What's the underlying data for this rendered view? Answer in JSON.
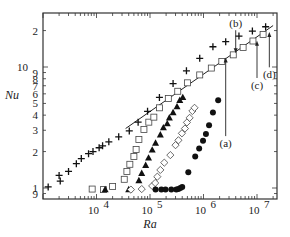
{
  "chart_data": {
    "type": "scatter",
    "title": "",
    "xlabel": "Ra",
    "ylabel": "Nu",
    "xscale": "log",
    "yscale": "log",
    "xlim": [
      1000,
      23000000
    ],
    "ylim": [
      0.86,
      24
    ],
    "grid": false,
    "legend": null,
    "x_ticks": [
      {
        "value": 10000,
        "label": "10",
        "exp": "4"
      },
      {
        "value": 100000,
        "label": "10",
        "exp": "5"
      },
      {
        "value": 1000000,
        "label": "10",
        "exp": "6"
      },
      {
        "value": 10000000,
        "label": "10",
        "exp": "7"
      }
    ],
    "y_ticks": [
      {
        "value": 0.9,
        "label": "9"
      },
      {
        "value": 1,
        "label": "1"
      },
      {
        "value": 2,
        "label": "2"
      },
      {
        "value": 3,
        "label": "3"
      },
      {
        "value": 4,
        "label": "4"
      },
      {
        "value": 5,
        "label": "5"
      },
      {
        "value": 6,
        "label": "6"
      },
      {
        "value": 7,
        "label": "7"
      },
      {
        "value": 8,
        "label": "8"
      },
      {
        "value": 9,
        "label": "9"
      },
      {
        "value": 10,
        "label": "10"
      },
      {
        "value": 20,
        "label": "2"
      }
    ],
    "series": [
      {
        "name": "plus",
        "marker": "plus",
        "points": [
          [
            1250,
            1.02
          ],
          [
            2000,
            1.27
          ],
          [
            2100,
            1.14
          ],
          [
            3000,
            1.37
          ],
          [
            4200,
            1.59
          ],
          [
            5200,
            1.75
          ],
          [
            7100,
            1.92
          ],
          [
            8600,
            2.0
          ],
          [
            11200,
            2.15
          ],
          [
            13000,
            2.23
          ],
          [
            17000,
            2.41
          ],
          [
            26000,
            2.65
          ],
          [
            41000,
            2.96
          ],
          [
            60000,
            3.5
          ],
          [
            90000,
            4.3
          ],
          [
            150000,
            5.6
          ],
          [
            270000,
            7.3
          ],
          [
            480000,
            9.3
          ],
          [
            850000,
            11.8
          ],
          [
            1500000,
            14.7
          ],
          [
            2600000,
            16.2
          ],
          [
            4600000,
            18.0
          ],
          [
            8200000,
            19.8
          ],
          [
            14500000,
            21.5
          ]
        ]
      },
      {
        "name": "open squares",
        "marker": "square-open",
        "points": [
          [
            8300,
            0.98
          ],
          [
            13500,
            0.97
          ],
          [
            20000,
            1.03
          ],
          [
            33000,
            1.18
          ],
          [
            37000,
            1.37
          ],
          [
            42000,
            1.57
          ],
          [
            50000,
            1.82
          ],
          [
            55000,
            2.08
          ],
          [
            62000,
            2.52
          ],
          [
            77000,
            3.05
          ],
          [
            95000,
            3.5
          ],
          [
            118000,
            3.85
          ],
          [
            150000,
            4.6
          ],
          [
            220000,
            5.5
          ],
          [
            330000,
            6.3
          ],
          [
            500000,
            7.4
          ],
          [
            850000,
            8.6
          ],
          [
            1400000,
            9.8
          ],
          [
            2200000,
            11.1
          ],
          [
            3600000,
            12.6
          ],
          [
            5500000,
            14.5
          ],
          [
            8400000,
            16.4
          ],
          [
            13000000,
            18.6
          ]
        ]
      },
      {
        "name": "filled triangles",
        "marker": "triangle-filled",
        "points": [
          [
            14500,
            0.97
          ],
          [
            40000,
            0.97
          ],
          [
            62000,
            1.15
          ],
          [
            70000,
            1.32
          ],
          [
            83000,
            1.54
          ],
          [
            94000,
            1.77
          ],
          [
            110000,
            2.06
          ],
          [
            127000,
            2.35
          ],
          [
            156000,
            2.75
          ],
          [
            178000,
            3.15
          ],
          [
            210000,
            3.4
          ],
          [
            230000,
            3.8
          ],
          [
            270000,
            4.2
          ],
          [
            320000,
            4.7
          ],
          [
            360000,
            5.3
          ],
          [
            410000,
            5.6
          ]
        ]
      },
      {
        "name": "open diamonds",
        "marker": "diamond-open",
        "points": [
          [
            44000,
            0.97
          ],
          [
            70000,
            0.98
          ],
          [
            110000,
            1.04
          ],
          [
            125000,
            1.1
          ],
          [
            137000,
            1.24
          ],
          [
            156000,
            1.41
          ],
          [
            185000,
            1.62
          ],
          [
            240000,
            1.87
          ],
          [
            300000,
            2.26
          ],
          [
            340000,
            2.48
          ],
          [
            395000,
            2.83
          ],
          [
            450000,
            3.1
          ],
          [
            490000,
            3.48
          ],
          [
            550000,
            3.8
          ],
          [
            620000,
            4.33
          ],
          [
            680000,
            4.6
          ]
        ]
      },
      {
        "name": "filled circles",
        "marker": "circle-filled",
        "points": [
          [
            127000,
            0.97
          ],
          [
            163000,
            0.97
          ],
          [
            195000,
            0.97
          ],
          [
            250000,
            0.97
          ],
          [
            310000,
            0.97
          ],
          [
            340000,
            0.98
          ],
          [
            370000,
            1.0
          ],
          [
            400000,
            1.02
          ],
          [
            520000,
            1.35
          ],
          [
            700000,
            1.82
          ],
          [
            830000,
            2.12
          ],
          [
            980000,
            2.46
          ],
          [
            1110000,
            2.8
          ],
          [
            1270000,
            3.3
          ],
          [
            1500000,
            4.2
          ],
          [
            1880000,
            5.3
          ]
        ]
      }
    ],
    "fit_line": {
      "from": [
        35000,
        3.1
      ],
      "to": [
        20000000,
        22
      ]
    },
    "annotations": [
      {
        "text": "(a)",
        "label_at": [
          2600000,
          2.35
        ],
        "arrow_to": [
          2600000,
          12.0
        ],
        "direction": "up"
      },
      {
        "text": "(b)",
        "label_at": [
          4000000,
          23
        ],
        "arrow_to": [
          4000000,
          13.0
        ],
        "direction": "down"
      },
      {
        "text": "(c)",
        "label_at": [
          10000000,
          7.1
        ],
        "arrow_to": [
          10000000,
          16.5
        ],
        "direction": "up"
      },
      {
        "text": "(d)",
        "label_at": [
          17000000,
          8.7
        ],
        "arrow_to": [
          17000000,
          19.5
        ],
        "direction": "up"
      }
    ]
  }
}
